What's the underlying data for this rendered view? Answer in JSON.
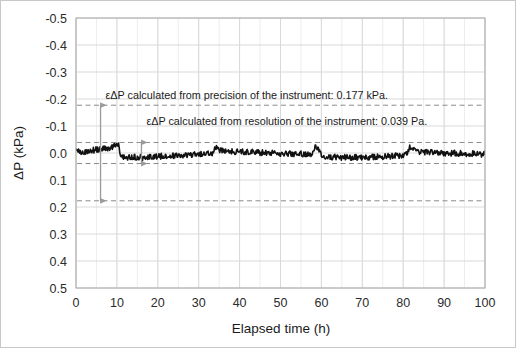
{
  "figure": {
    "background": "#ffffff",
    "border_color": "#c8c8c8"
  },
  "chart_data": {
    "type": "line",
    "title": "",
    "xlabel": "Elapsed time (h)",
    "ylabel": "ΔP (kPa)",
    "xlim": [
      0,
      100
    ],
    "ylim": [
      -0.5,
      0.5
    ],
    "y_axis_inverted": true,
    "xticks": [
      0,
      10,
      20,
      30,
      40,
      50,
      60,
      70,
      80,
      90,
      100
    ],
    "xtick_labels": [
      "0",
      "10",
      "20",
      "30",
      "40",
      "50",
      "60",
      "70",
      "80",
      "90",
      "100"
    ],
    "yticks": [
      -0.5,
      -0.4,
      -0.3,
      -0.2,
      -0.1,
      0.0,
      0.1,
      0.2,
      0.3,
      0.4,
      0.5
    ],
    "ytick_labels": [
      "-0.5",
      "-0.4",
      "-0.3",
      "-0.2",
      "-0.1",
      "0.0",
      "0.1",
      "0.2",
      "0.3",
      "0.4",
      "0.5"
    ],
    "grid": true,
    "grid_color": "#d9d9d9",
    "minor_grid_color": "#ededed",
    "minor_x_step": 5,
    "legend": "none",
    "series": [
      {
        "name": "ΔP",
        "color": "#111111",
        "line_width": 1.6,
        "x": [
          0,
          0.5,
          1,
          1.5,
          2,
          2.5,
          3,
          3.5,
          4,
          4.5,
          5,
          5.5,
          6,
          6.5,
          7,
          7.5,
          8,
          8.5,
          9,
          9.5,
          9.8,
          10.1,
          10.4,
          11,
          11.5,
          12,
          12.5,
          13,
          13.5,
          14,
          14.5,
          15,
          15.5,
          16,
          16.5,
          17,
          17.5,
          18,
          18.5,
          19,
          19.5,
          20,
          21,
          22,
          23,
          24,
          25,
          26,
          27,
          28,
          29,
          30,
          31,
          32,
          33,
          33.6,
          33.9,
          34.2,
          34.6,
          35,
          36,
          37,
          38,
          39,
          40,
          41,
          42,
          43,
          44,
          45,
          46,
          47,
          48,
          49,
          50,
          51,
          52,
          53,
          54,
          55,
          56,
          57,
          57.6,
          57.9,
          58.2,
          58.6,
          59,
          60,
          61,
          62,
          63,
          64,
          65,
          66,
          67,
          68,
          69,
          70,
          71,
          72,
          73,
          74,
          75,
          76,
          77,
          78,
          79,
          80,
          80.6,
          80.9,
          81.2,
          81.6,
          82,
          83,
          84,
          85,
          86,
          87,
          88,
          89,
          90,
          91,
          92,
          93,
          94,
          95,
          96,
          97,
          98,
          99,
          100
        ],
        "y": [
          -0.004,
          -0.005,
          -0.004,
          -0.006,
          -0.005,
          -0.007,
          -0.008,
          -0.009,
          -0.01,
          -0.011,
          -0.012,
          -0.013,
          -0.014,
          -0.015,
          -0.017,
          -0.018,
          -0.019,
          -0.021,
          -0.023,
          -0.026,
          -0.03,
          -0.034,
          -0.03,
          0.012,
          0.016,
          0.017,
          0.016,
          0.017,
          0.016,
          0.017,
          0.016,
          0.017,
          0.016,
          0.018,
          0.017,
          0.016,
          0.015,
          0.016,
          0.015,
          0.014,
          0.014,
          0.013,
          0.012,
          0.011,
          0.01,
          0.01,
          0.009,
          0.008,
          0.008,
          0.007,
          0.006,
          0.005,
          0.004,
          0.003,
          0.002,
          -0.002,
          -0.012,
          -0.02,
          -0.014,
          -0.01,
          -0.008,
          -0.007,
          -0.006,
          -0.005,
          -0.005,
          -0.004,
          -0.003,
          -0.003,
          -0.002,
          -0.002,
          -0.001,
          -0.001,
          0.0,
          0.0,
          0.001,
          0.001,
          0.002,
          0.002,
          0.003,
          0.003,
          0.004,
          0.004,
          0.003,
          -0.001,
          -0.014,
          -0.024,
          -0.018,
          0.01,
          0.013,
          0.014,
          0.015,
          0.015,
          0.016,
          0.016,
          0.017,
          0.017,
          0.016,
          0.016,
          0.015,
          0.015,
          0.014,
          0.014,
          0.013,
          0.012,
          0.012,
          0.011,
          0.01,
          0.009,
          0.008,
          0.004,
          -0.008,
          -0.02,
          -0.014,
          -0.006,
          -0.004,
          -0.003,
          -0.002,
          -0.002,
          -0.001,
          -0.001,
          0.0,
          0.0,
          0.001,
          0.001,
          0.002,
          0.002,
          0.003,
          0.003,
          0.004,
          0.004,
          0.005
        ],
        "noise_amplitude": 0.011
      }
    ],
    "reference_lines": [
      {
        "name": "precision-upper",
        "value": -0.177,
        "style": "dashed",
        "color": "#8c8c8c"
      },
      {
        "name": "precision-lower",
        "value": 0.177,
        "style": "dashed",
        "color": "#8c8c8c"
      },
      {
        "name": "resolution-upper",
        "value": -0.039,
        "style": "dashed",
        "color": "#8c8c8c"
      },
      {
        "name": "resolution-lower",
        "value": 0.039,
        "style": "dashed",
        "color": "#8c8c8c"
      }
    ],
    "annotations": [
      {
        "name": "precision-annotation",
        "text": "εΔP calculated from precision of the instrument: 0.177 kPa.",
        "x": 6,
        "y": -0.2
      },
      {
        "name": "resolution-annotation",
        "text": "εΔP calculated from resolution of the instrument: 0.039 Pa.",
        "x": 16,
        "y": -0.105
      }
    ],
    "arrows": [
      {
        "name": "precision-arrow",
        "x": 6,
        "y_from": -0.177,
        "y_to": 0.177,
        "double_headed": true,
        "color": "#9a9a9a"
      },
      {
        "name": "resolution-arrow",
        "x": 16,
        "y_from": -0.039,
        "y_to": 0.039,
        "double_headed": true,
        "color": "#9a9a9a"
      }
    ]
  }
}
